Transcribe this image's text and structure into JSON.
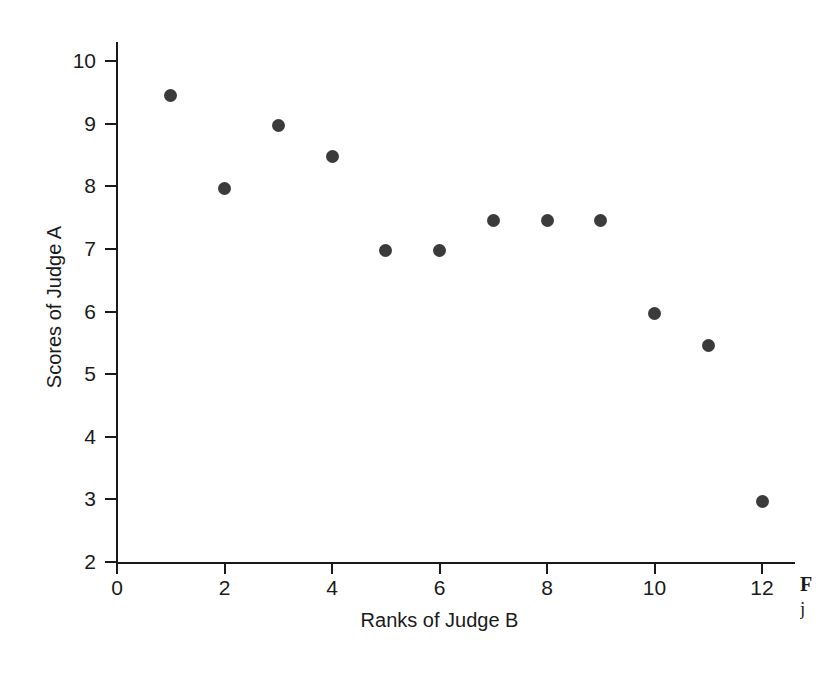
{
  "chart_data": {
    "type": "scatter",
    "title": "",
    "xlabel": "Ranks of Judge B",
    "ylabel": "Scores of Judge A",
    "xlim": [
      0,
      12.6
    ],
    "ylim": [
      2,
      10.3
    ],
    "xticks": [
      0,
      2,
      4,
      6,
      8,
      10,
      12
    ],
    "xtick_labels": [
      "0",
      "2",
      "4",
      "6",
      "8",
      "10",
      "12"
    ],
    "yticks": [
      2,
      3,
      4,
      5,
      6,
      7,
      8,
      9,
      10
    ],
    "ytick_labels": [
      "2",
      "3",
      "4",
      "5",
      "6",
      "7",
      "8",
      "9",
      "10"
    ],
    "grid": false,
    "legend": null,
    "marker": {
      "shape": "circle",
      "color": "#3b3b3b",
      "size_px": 13
    },
    "x": [
      1,
      2,
      3,
      4,
      5,
      6,
      7,
      8,
      9,
      10,
      11,
      12
    ],
    "y": [
      9.45,
      7.97,
      8.97,
      8.47,
      6.97,
      6.97,
      7.45,
      7.45,
      7.45,
      5.97,
      5.45,
      2.97
    ],
    "points": [
      {
        "x": 1,
        "y": 9.45
      },
      {
        "x": 2,
        "y": 7.97
      },
      {
        "x": 3,
        "y": 8.97
      },
      {
        "x": 4,
        "y": 8.47
      },
      {
        "x": 5,
        "y": 6.97
      },
      {
        "x": 6,
        "y": 6.97
      },
      {
        "x": 7,
        "y": 7.45
      },
      {
        "x": 8,
        "y": 7.45
      },
      {
        "x": 9,
        "y": 7.45
      },
      {
        "x": 10,
        "y": 5.97
      },
      {
        "x": 11,
        "y": 5.45
      },
      {
        "x": 12,
        "y": 2.97
      }
    ]
  },
  "caption_fragment": {
    "line1": "F",
    "line2": "j"
  },
  "colors": {
    "background": "#ffffff",
    "axis": "#1a1a1a",
    "marker": "#3b3b3b",
    "text": "#1a1a1a"
  }
}
